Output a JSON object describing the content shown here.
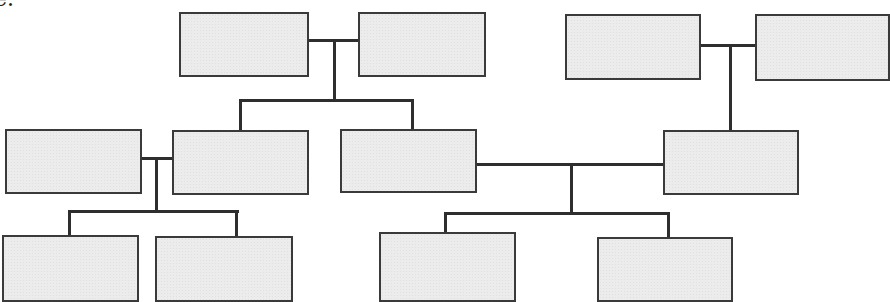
{
  "caption_fragment": "e.",
  "diagram": {
    "type": "family-tree",
    "line_color": "#2e2e2e",
    "box_fill": "#ececec",
    "box_border": "#3a3a3a",
    "boxes": [
      {
        "id": "gp1-a",
        "x": 179,
        "y": 12,
        "w": 130,
        "h": 65,
        "label": ""
      },
      {
        "id": "gp1-b",
        "x": 358,
        "y": 12,
        "w": 128,
        "h": 65,
        "label": ""
      },
      {
        "id": "gp2-a",
        "x": 565,
        "y": 14,
        "w": 136,
        "h": 66,
        "label": ""
      },
      {
        "id": "gp2-b",
        "x": 755,
        "y": 14,
        "w": 133,
        "h": 67,
        "label": ""
      },
      {
        "id": "p-left-spouse",
        "x": 5,
        "y": 129,
        "w": 137,
        "h": 65,
        "label": ""
      },
      {
        "id": "p-child1",
        "x": 172,
        "y": 130,
        "w": 137,
        "h": 65,
        "label": ""
      },
      {
        "id": "p-child2",
        "x": 340,
        "y": 129,
        "w": 137,
        "h": 64,
        "label": ""
      },
      {
        "id": "p-gp2-child",
        "x": 663,
        "y": 130,
        "w": 136,
        "h": 65,
        "label": ""
      },
      {
        "id": "c-1",
        "x": 2,
        "y": 235,
        "w": 137,
        "h": 65,
        "label": ""
      },
      {
        "id": "c-2",
        "x": 155,
        "y": 236,
        "w": 138,
        "h": 64,
        "label": ""
      },
      {
        "id": "c-3",
        "x": 379,
        "y": 232,
        "w": 137,
        "h": 68,
        "label": ""
      },
      {
        "id": "c-4",
        "x": 597,
        "y": 237,
        "w": 136,
        "h": 63,
        "label": ""
      }
    ]
  }
}
